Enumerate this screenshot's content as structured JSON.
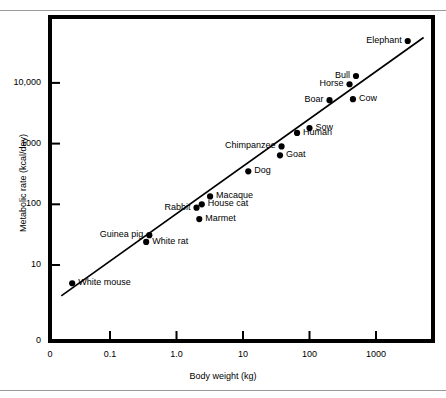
{
  "figure": {
    "background_color": "#ffffff",
    "ink_color": "#000000",
    "rule_color": "#9a9a9a",
    "top_rule": true,
    "bottom_rule": true
  },
  "chart_data": {
    "type": "scatter",
    "title": "",
    "subtitle": "",
    "xlabel": "Body weight (kg)",
    "ylabel": "Metabolic rate (kcal/day)",
    "x_scale": "log",
    "y_scale": "log",
    "xlim": [
      0.02,
      6000
    ],
    "ylim": [
      2,
      60000
    ],
    "grid": false,
    "legend": "none",
    "x_tick_labels": [
      "0",
      "0.1",
      "1.0",
      "10",
      "100",
      "1000"
    ],
    "y_tick_labels": [
      "0",
      "10",
      "100",
      "1000",
      "10,000"
    ],
    "x_ticks": [
      0,
      0.1,
      1.0,
      10,
      100,
      1000
    ],
    "y_ticks": [
      0,
      10,
      100,
      1000,
      10000
    ],
    "annotations": [
      {
        "label": "Elephant",
        "x": 3000,
        "y": 49000,
        "label_side": "left"
      },
      {
        "label": "Bull",
        "x": 500,
        "y": 13000,
        "label_side": "left"
      },
      {
        "label": "Horse",
        "x": 400,
        "y": 9500,
        "label_side": "left"
      },
      {
        "label": "Cow",
        "x": 450,
        "y": 5400,
        "label_side": "right"
      },
      {
        "label": "Boar",
        "x": 200,
        "y": 5200,
        "label_side": "left"
      },
      {
        "label": "Sow",
        "x": 100,
        "y": 1800,
        "label_side": "right"
      },
      {
        "label": "Human",
        "x": 65,
        "y": 1500,
        "label_side": "right"
      },
      {
        "label": "Chimpanzee",
        "x": 38,
        "y": 900,
        "label_side": "left"
      },
      {
        "label": "Goat",
        "x": 36,
        "y": 640,
        "label_side": "right"
      },
      {
        "label": "Dog",
        "x": 12,
        "y": 350,
        "label_side": "right"
      },
      {
        "label": "Macaque",
        "x": 3.2,
        "y": 135,
        "label_side": "right"
      },
      {
        "label": "House cat",
        "x": 2.4,
        "y": 100,
        "label_side": "right"
      },
      {
        "label": "Rabbit",
        "x": 2.0,
        "y": 88,
        "label_side": "left"
      },
      {
        "label": "Marmet",
        "x": 2.2,
        "y": 57,
        "label_side": "right"
      },
      {
        "label": "Guinea pig",
        "x": 0.39,
        "y": 31,
        "label_side": "left"
      },
      {
        "label": "White rat",
        "x": 0.35,
        "y": 24,
        "label_side": "right"
      },
      {
        "label": "White mouse",
        "x": 0.027,
        "y": 5.0,
        "label_side": "right"
      }
    ],
    "series": [
      {
        "name": "Animals",
        "marker": "filled-circle",
        "x": [
          3000,
          500,
          400,
          450,
          200,
          100,
          65,
          38,
          36,
          12,
          3.2,
          2.4,
          2.0,
          2.2,
          0.39,
          0.35,
          0.027
        ],
        "y": [
          49000,
          13000,
          9500,
          5400,
          5200,
          1800,
          1500,
          900,
          640,
          350,
          135,
          100,
          88,
          57,
          31,
          24,
          5.0
        ]
      }
    ],
    "fit_line": {
      "name": "Kleiber regression line",
      "style": "solid",
      "x_start": 0.0185,
      "y_start": 3.1,
      "x_end": 5200,
      "y_end": 56000
    }
  }
}
